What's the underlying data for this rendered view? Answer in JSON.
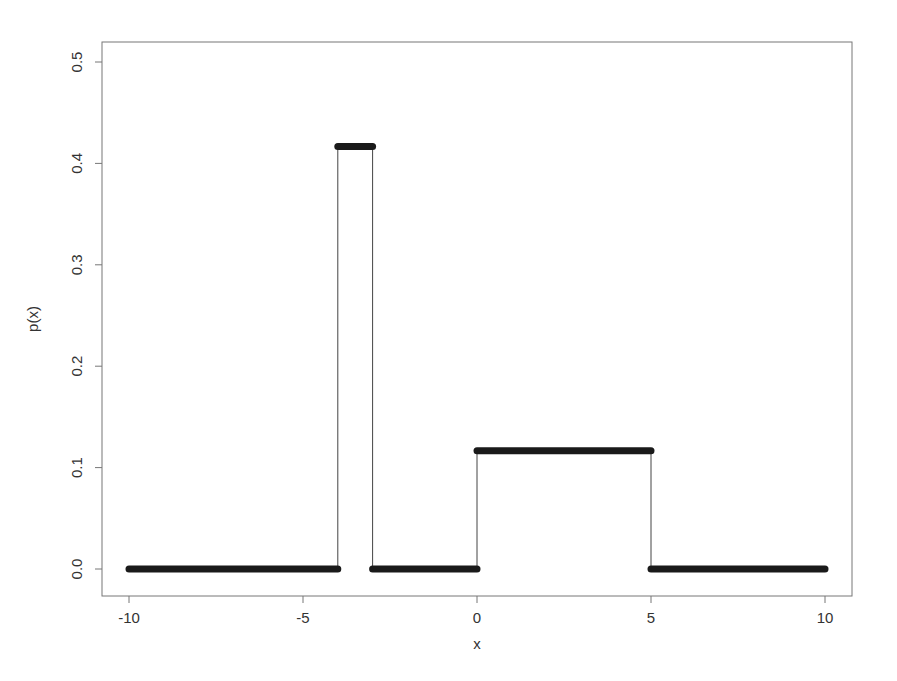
{
  "chart_data": {
    "type": "line",
    "title": "",
    "xlabel": "x",
    "ylabel": "p(x)",
    "xlim": [
      -10.8,
      10.8
    ],
    "ylim": [
      -0.026,
      0.52
    ],
    "grid": false,
    "legend": null,
    "x_ticks": [
      -10,
      -5,
      0,
      5,
      10
    ],
    "x_tick_labels": [
      "-10",
      "-5",
      "0",
      "5",
      "10"
    ],
    "y_ticks": [
      0.0,
      0.1,
      0.2,
      0.3,
      0.4,
      0.5
    ],
    "y_tick_labels": [
      "0.0",
      "0.1",
      "0.2",
      "0.3",
      "0.4",
      "0.5"
    ],
    "series": [
      {
        "name": "p(x)",
        "style": "piecewise constant density drawn as thick points with thin vertical connectors",
        "segments": [
          {
            "x_start": -10,
            "x_end": -4,
            "y": 0.0
          },
          {
            "x_start": -4,
            "x_end": -3,
            "y": 0.4167
          },
          {
            "x_start": -3,
            "x_end": 0,
            "y": 0.0
          },
          {
            "x_start": 0,
            "x_end": 5,
            "y": 0.1167
          },
          {
            "x_start": 5,
            "x_end": 10,
            "y": 0.0
          }
        ]
      }
    ]
  },
  "labels": {
    "xlabel": "x",
    "ylabel": "p(x)",
    "x_ticks": [
      "-10",
      "-5",
      "0",
      "5",
      "10"
    ],
    "y_ticks": [
      "0.0",
      "0.1",
      "0.2",
      "0.3",
      "0.4",
      "0.5"
    ]
  }
}
